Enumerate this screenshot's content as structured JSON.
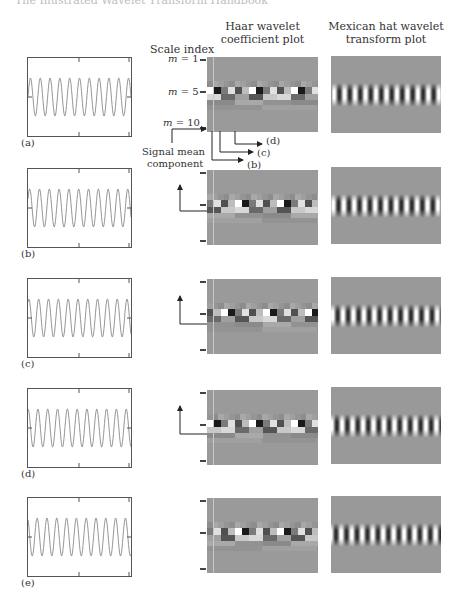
{
  "header": {
    "text": "The Illustrated Wavelet Transform Handbook"
  },
  "columns": {
    "scale_index": "Scale index",
    "haar_line1": "Haar wavelet",
    "haar_line2": "coefficient plot",
    "mex_line1": "Mexican hat wavelet",
    "mex_line2": "transform plot"
  },
  "scale_labels": [
    {
      "m": "m",
      "eq": " = 1"
    },
    {
      "m": "m",
      "eq": " = 5"
    },
    {
      "m": "m",
      "eq": " = 10"
    }
  ],
  "annotations": {
    "signal_mean_line1": "Signal mean",
    "signal_mean_line2": "component",
    "arrow_b": "(b)",
    "arrow_c": "(c)",
    "arrow_d": "(d)"
  },
  "rows": [
    {
      "label": "(a)",
      "cycles": 10.5,
      "phase": 0.0,
      "shift": 0
    },
    {
      "label": "(b)",
      "cycles": 10.5,
      "phase": 0.5,
      "shift": 1
    },
    {
      "label": "(c)",
      "cycles": 10.5,
      "phase": 1.0,
      "shift": 2
    },
    {
      "label": "(d)",
      "cycles": 10.5,
      "phase": 1.5,
      "shift": 3
    },
    {
      "label": "(e)",
      "cycles": 10.5,
      "phase": 2.0,
      "shift": 4
    }
  ]
}
